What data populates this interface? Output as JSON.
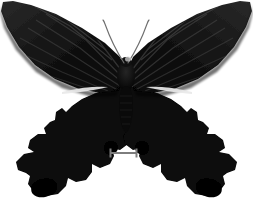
{
  "plate": {
    "width": 253,
    "height": 205,
    "background_color": "#ffffff",
    "subject": "butterfly-specimen",
    "subject_label": "Black swallowtail butterfly specimen, dorsal view, wings spread",
    "view": "dorsal",
    "alt_text": "Pinned dark butterfly specimen with spread wings photographed on a plain white background with a scale bar below"
  },
  "specimen": {
    "body": {
      "label": "butterfly-body",
      "color": "#0a0a0a",
      "head_center_x": 126,
      "thorax_center_y": 82,
      "abdomen_tip_y": 133
    },
    "forewings": {
      "label": "forewings",
      "color": "#0d0d0d",
      "vein_color": "#3a3a3a",
      "vein_count": 11,
      "left_tip_x": 2,
      "right_tip_x": 251,
      "top_y": 2
    },
    "hindwings": {
      "label": "hindwings",
      "color": "#050505",
      "scallop_count": 5,
      "has_tails": true,
      "bottom_y": 196
    },
    "streaks": {
      "label": "pale-wing-streaks",
      "color": "#e8e8e8",
      "left": {
        "x1": 62,
        "y1": 91,
        "x2": 108,
        "y2": 88
      },
      "right": {
        "x1": 144,
        "y1": 88,
        "x2": 192,
        "y2": 91
      }
    },
    "antennae": {
      "label": "antennae",
      "color": "#6e6e6e",
      "count": 2,
      "left_tip_x": 103,
      "right_tip_x": 149,
      "tip_y": 20,
      "base_x": 126,
      "base_y": 63
    }
  },
  "scale_bar": {
    "label": "scale-bar",
    "color": "#7d7d7d",
    "x_start": 110,
    "x_end": 137,
    "y": 153,
    "length_px": 27,
    "cap_height_px": 9,
    "line_thickness_px": 2,
    "caption": ""
  }
}
